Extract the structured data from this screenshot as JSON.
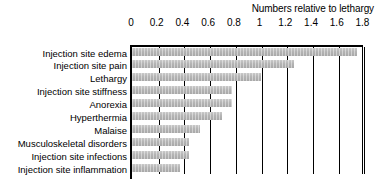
{
  "chart_data": {
    "type": "bar",
    "orientation": "horizontal",
    "title": "Numbers relative to lethargy",
    "xlabel": "",
    "ylabel": "",
    "xlim": [
      0,
      1.8
    ],
    "grid": true,
    "legend": "none",
    "xticks": [
      "0",
      "0.2",
      "0.4",
      "0.6",
      "0.8",
      "1",
      "1.2",
      "1.4",
      "1.6",
      "1.8"
    ],
    "xtick_values": [
      0,
      0.2,
      0.4,
      0.6,
      0.8,
      1.0,
      1.2,
      1.4,
      1.6,
      1.8
    ],
    "categories": [
      "Injection site edema",
      "Injection site pain",
      "Lethargy",
      "Injection site stiffness",
      "Anorexia",
      "Hyperthermia",
      "Malaise",
      "Musculoskeletal disorders",
      "Injection site infections",
      "Injection site inflammation"
    ],
    "values": [
      1.75,
      1.26,
      1.0,
      0.78,
      0.78,
      0.7,
      0.53,
      0.44,
      0.44,
      0.37
    ],
    "bar_color": "#b4b4b4",
    "axis_color": "#000000"
  }
}
